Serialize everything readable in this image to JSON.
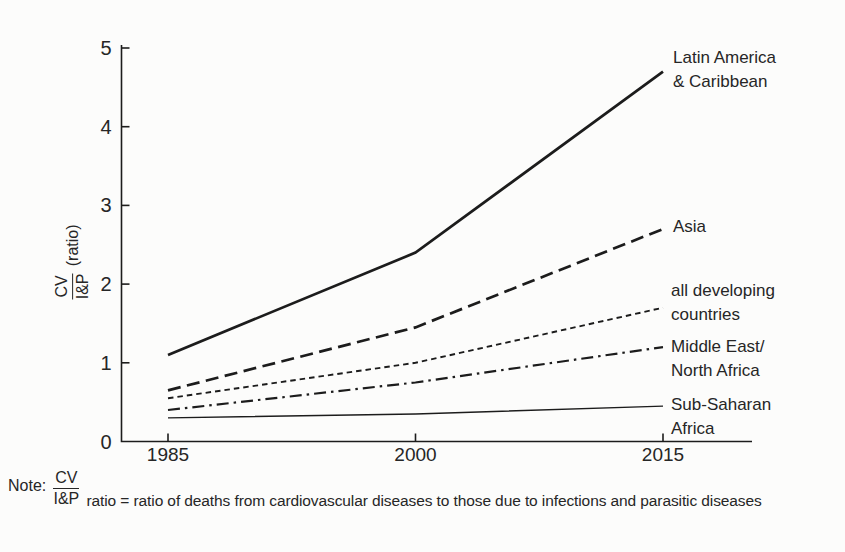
{
  "chart_data": {
    "type": "line",
    "title": "",
    "xlabel": "",
    "ylabel": {
      "numerator": "CV",
      "denominator": "I&P",
      "suffix": "(ratio)"
    },
    "x": [
      1985,
      2000,
      2015
    ],
    "x_ticks": [
      "1985",
      "2000",
      "2015"
    ],
    "y_ticks": [
      "0",
      "1",
      "2",
      "3",
      "4",
      "5"
    ],
    "xlim": [
      1985,
      2015
    ],
    "ylim": [
      0,
      5
    ],
    "grid": false,
    "legend_position": "right-of-line-ends",
    "line_color": "#1c1c1c",
    "series": [
      {
        "name": "Latin America & Caribbean",
        "label_lines": [
          "Latin America",
          "& Caribbean"
        ],
        "values": [
          1.1,
          2.4,
          4.7
        ],
        "line_style": "solid-bold"
      },
      {
        "name": "Asia",
        "label_lines": [
          "Asia",
          ""
        ],
        "values": [
          0.65,
          1.45,
          2.7
        ],
        "line_style": "long-dash"
      },
      {
        "name": "all developing countries",
        "label_lines": [
          "all developing",
          "countries"
        ],
        "values": [
          0.55,
          1.0,
          1.7
        ],
        "line_style": "short-dash"
      },
      {
        "name": "Middle East/North Africa",
        "label_lines": [
          "Middle East/",
          "North Africa"
        ],
        "values": [
          0.4,
          0.75,
          1.2
        ],
        "line_style": "dash-dot"
      },
      {
        "name": "Sub-Saharan Africa",
        "label_lines": [
          "Sub-Saharan",
          "Africa"
        ],
        "values": [
          0.3,
          0.35,
          0.45
        ],
        "line_style": "solid-thin"
      }
    ]
  },
  "note": {
    "label": "Note:",
    "fraction_numerator": "CV",
    "fraction_denominator": "I&P",
    "text": "ratio = ratio of deaths from cardiovascular diseases to those due to infections and parasitic diseases"
  }
}
